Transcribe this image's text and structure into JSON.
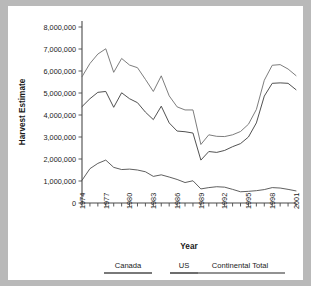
{
  "chart_data": {
    "type": "line",
    "title": "",
    "xlabel": "Year",
    "ylabel": "Harvest Estimate",
    "x": [
      1974,
      1975,
      1976,
      1977,
      1978,
      1979,
      1980,
      1981,
      1982,
      1983,
      1984,
      1985,
      1986,
      1987,
      1988,
      1989,
      1990,
      1991,
      1992,
      1993,
      1994,
      1995,
      1996,
      1997,
      1998,
      1999,
      2000,
      2001
    ],
    "xlim": [
      1974,
      2001
    ],
    "ylim": [
      0,
      8000000
    ],
    "ytick_labels": [
      "0",
      "1,000,000",
      "2,000,000",
      "3,000,000",
      "4,000,000",
      "5,000,000",
      "6,000,000",
      "7,000,000",
      "8,000,000"
    ],
    "ytick_values": [
      0,
      1000000,
      2000000,
      3000000,
      4000000,
      5000000,
      6000000,
      7000000,
      8000000
    ],
    "xtick_labels": [
      "1974",
      "1977",
      "1980",
      "1983",
      "1986",
      "1989",
      "1992",
      "1995",
      "1998",
      "2001"
    ],
    "xtick_values": [
      1974,
      1977,
      1980,
      1983,
      1986,
      1989,
      1992,
      1995,
      1998,
      2001
    ],
    "grid": false,
    "legend_position": "bottom",
    "series": [
      {
        "name": "Canada",
        "color": "#4d4d4d",
        "values": [
          1030000,
          1560000,
          1800000,
          1950000,
          1620000,
          1520000,
          1540000,
          1500000,
          1420000,
          1210000,
          1280000,
          1180000,
          1070000,
          930000,
          1010000,
          640000,
          700000,
          740000,
          720000,
          620000,
          510000,
          530000,
          560000,
          610000,
          700000,
          680000,
          620000,
          550000
        ]
      },
      {
        "name": "US",
        "color": "#3d3d3d",
        "values": [
          4380000,
          4740000,
          5030000,
          5070000,
          4350000,
          5010000,
          4740000,
          4560000,
          4130000,
          3790000,
          4400000,
          3640000,
          3270000,
          3240000,
          3180000,
          1950000,
          2340000,
          2300000,
          2390000,
          2560000,
          2700000,
          3000000,
          3640000,
          4860000,
          5440000,
          5460000,
          5440000,
          5630000
        ]
      },
      {
        "name": "Continental Total",
        "color": "#6e6e6e",
        "values": [
          5740000,
          6340000,
          6770000,
          7010000,
          5940000,
          6570000,
          6270000,
          6150000,
          5620000,
          5070000,
          5780000,
          4870000,
          4370000,
          4230000,
          4230000,
          2660000,
          3100000,
          3030000,
          3020000,
          3100000,
          3250000,
          3580000,
          4250000,
          5580000,
          6260000,
          6290000,
          6090000,
          6310000
        ]
      }
    ],
    "series_end_adjust": {
      "us_2001": 5150000,
      "total_2001": 5790000
    }
  },
  "legend": {
    "items": [
      {
        "label": "Canada"
      },
      {
        "label": "US"
      },
      {
        "label": "Continental Total"
      }
    ]
  }
}
